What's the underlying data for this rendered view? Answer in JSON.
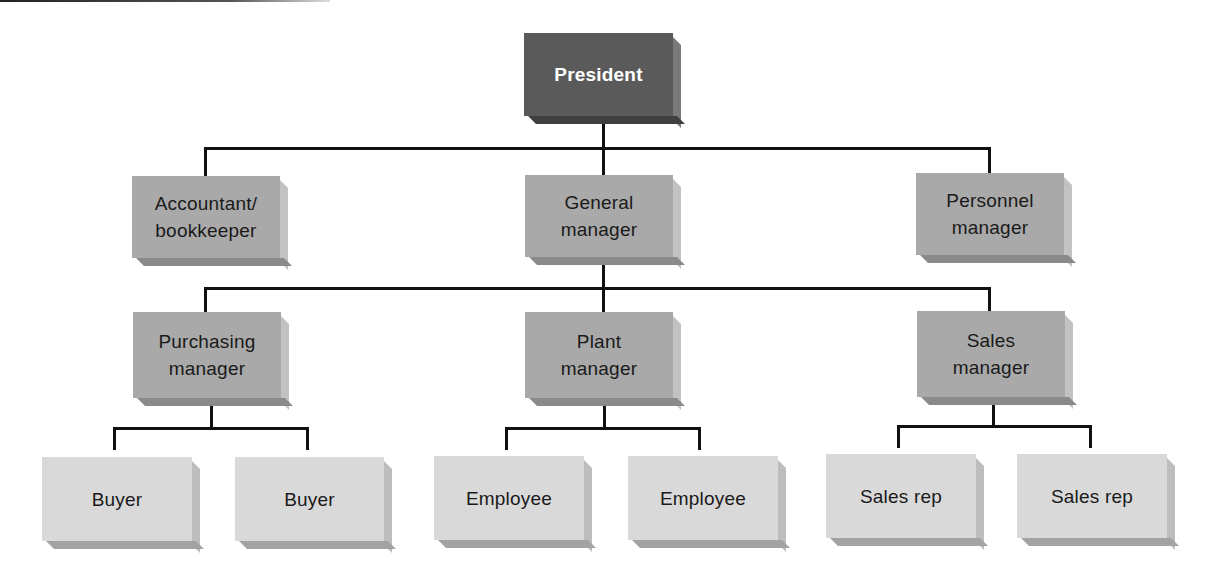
{
  "chart": {
    "type": "org-chart",
    "root": {
      "label": "President",
      "children": [
        {
          "label": "Accountant/\nbookkeeper"
        },
        {
          "label": "General\nmanager",
          "children": [
            {
              "label": "Purchasing\nmanager",
              "children": [
                {
                  "label": "Buyer"
                },
                {
                  "label": "Buyer"
                }
              ]
            },
            {
              "label": "Plant\nmanager",
              "children": [
                {
                  "label": "Employee"
                },
                {
                  "label": "Employee"
                }
              ]
            },
            {
              "label": "Sales\nmanager",
              "children": [
                {
                  "label": "Sales rep"
                },
                {
                  "label": "Sales rep"
                }
              ]
            }
          ]
        },
        {
          "label": "Personnel\nmanager"
        }
      ]
    }
  },
  "nodes": {
    "president": "President",
    "accountant": "Accountant/\nbookkeeper",
    "general_manager": "General\nmanager",
    "personnel_manager": "Personnel\nmanager",
    "purchasing_manager": "Purchasing\nmanager",
    "plant_manager": "Plant\nmanager",
    "sales_manager": "Sales\nmanager",
    "buyer_1": "Buyer",
    "buyer_2": "Buyer",
    "employee_1": "Employee",
    "employee_2": "Employee",
    "sales_rep_1": "Sales rep",
    "sales_rep_2": "Sales rep"
  },
  "colors": {
    "top_level": "#5a5a5a",
    "middle_levels": "#a9a9a9",
    "leaf_level": "#d9d9d9",
    "connector": "#111111"
  }
}
